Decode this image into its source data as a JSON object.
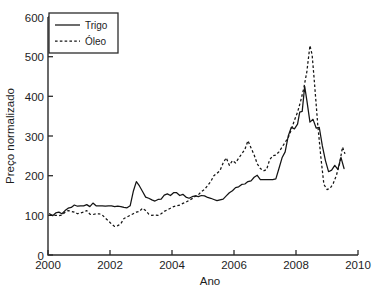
{
  "chart_data": {
    "type": "line",
    "title": "",
    "xlabel": "Ano",
    "ylabel": "Preço normalizado",
    "xlim": [
      2000,
      2010
    ],
    "ylim": [
      0,
      600
    ],
    "xticks": [
      2000,
      2002,
      2004,
      2006,
      2008,
      2010
    ],
    "yticks": [
      0,
      100,
      200,
      300,
      400,
      500,
      600
    ],
    "grid": false,
    "legend_position": "upper left",
    "legend_entries": [
      "Trigo",
      "Óleo"
    ],
    "series": [
      {
        "name": "Trigo",
        "style": "solid",
        "color": "#141414",
        "x": [
          2000.05,
          2000.15,
          2000.25,
          2000.35,
          2000.45,
          2000.55,
          2000.65,
          2000.75,
          2000.85,
          2000.95,
          2001.05,
          2001.15,
          2001.25,
          2001.35,
          2001.45,
          2001.55,
          2001.65,
          2001.75,
          2001.85,
          2001.95,
          2002.05,
          2002.15,
          2002.25,
          2002.35,
          2002.45,
          2002.55,
          2002.65,
          2002.75,
          2002.85,
          2002.95,
          2003.05,
          2003.15,
          2003.25,
          2003.35,
          2003.45,
          2003.55,
          2003.65,
          2003.75,
          2003.85,
          2003.95,
          2004.05,
          2004.15,
          2004.25,
          2004.35,
          2004.45,
          2004.55,
          2004.65,
          2004.75,
          2004.85,
          2004.95,
          2005.05,
          2005.15,
          2005.25,
          2005.35,
          2005.45,
          2005.55,
          2005.65,
          2005.75,
          2005.85,
          2005.95,
          2006.05,
          2006.15,
          2006.25,
          2006.35,
          2006.45,
          2006.55,
          2006.65,
          2006.75,
          2006.85,
          2006.95,
          2007.05,
          2007.15,
          2007.25,
          2007.35,
          2007.45,
          2007.55,
          2007.65,
          2007.75,
          2007.85,
          2007.95,
          2008.05,
          2008.12,
          2008.2,
          2008.28,
          2008.35,
          2008.45,
          2008.55,
          2008.65,
          2008.75,
          2008.85,
          2008.95,
          2009.05,
          2009.15,
          2009.25,
          2009.35,
          2009.45,
          2009.55
        ],
        "y": [
          104,
          99,
          106,
          108,
          104,
          112,
          118,
          120,
          126,
          123,
          124,
          124,
          127,
          122,
          131,
          124,
          124,
          124,
          123,
          124,
          124,
          122,
          123,
          122,
          120,
          119,
          124,
          160,
          185,
          174,
          160,
          146,
          143,
          139,
          136,
          140,
          141,
          151,
          154,
          150,
          157,
          157,
          150,
          153,
          146,
          143,
          147,
          149,
          147,
          150,
          149,
          145,
          143,
          140,
          137,
          139,
          141,
          149,
          157,
          162,
          170,
          172,
          178,
          179,
          185,
          187,
          196,
          201,
          190,
          190,
          190,
          190,
          190,
          192,
          218,
          245,
          260,
          300,
          322,
          318,
          330,
          360,
          362,
          425,
          390,
          335,
          342,
          320,
          322,
          275,
          238,
          210,
          214,
          226,
          216,
          246,
          218
        ]
      },
      {
        "name": "Óleo",
        "style": "dashed",
        "color": "#141414",
        "x": [
          2000.05,
          2000.15,
          2000.25,
          2000.35,
          2000.45,
          2000.55,
          2000.65,
          2000.75,
          2000.85,
          2000.95,
          2001.05,
          2001.15,
          2001.25,
          2001.35,
          2001.45,
          2001.55,
          2001.65,
          2001.75,
          2001.85,
          2001.95,
          2002.05,
          2002.15,
          2002.25,
          2002.35,
          2002.45,
          2002.55,
          2002.65,
          2002.75,
          2002.85,
          2002.95,
          2003.05,
          2003.15,
          2003.25,
          2003.35,
          2003.45,
          2003.55,
          2003.65,
          2003.75,
          2003.85,
          2003.95,
          2004.05,
          2004.15,
          2004.25,
          2004.35,
          2004.45,
          2004.55,
          2004.65,
          2004.75,
          2004.85,
          2004.95,
          2005.05,
          2005.15,
          2005.25,
          2005.35,
          2005.45,
          2005.55,
          2005.65,
          2005.75,
          2005.85,
          2005.95,
          2006.05,
          2006.15,
          2006.25,
          2006.35,
          2006.45,
          2006.55,
          2006.65,
          2006.75,
          2006.85,
          2006.95,
          2007.05,
          2007.15,
          2007.25,
          2007.35,
          2007.45,
          2007.55,
          2007.65,
          2007.75,
          2007.85,
          2007.95,
          2008.05,
          2008.15,
          2008.25,
          2008.35,
          2008.45,
          2008.52,
          2008.6,
          2008.7,
          2008.8,
          2008.9,
          2009.0,
          2009.1,
          2009.2,
          2009.3,
          2009.4,
          2009.5,
          2009.58
        ],
        "y": [
          100,
          100,
          100,
          99,
          101,
          108,
          112,
          110,
          108,
          104,
          106,
          108,
          112,
          103,
          102,
          104,
          104,
          101,
          93,
          86,
          78,
          72,
          74,
          79,
          92,
          96,
          100,
          104,
          108,
          110,
          118,
          112,
          103,
          100,
          101,
          100,
          104,
          110,
          114,
          118,
          122,
          124,
          126,
          130,
          133,
          138,
          142,
          148,
          152,
          160,
          165,
          175,
          185,
          200,
          206,
          213,
          232,
          245,
          226,
          238,
          232,
          244,
          255,
          266,
          288,
          270,
          252,
          230,
          218,
          212,
          215,
          240,
          250,
          252,
          260,
          272,
          284,
          296,
          316,
          340,
          360,
          388,
          420,
          462,
          528,
          505,
          430,
          330,
          248,
          178,
          165,
          168,
          180,
          200,
          228,
          272,
          255
        ]
      }
    ]
  },
  "axes": {
    "x_tick_labels": [
      "2000",
      "2002",
      "2004",
      "2006",
      "2008",
      "2010"
    ],
    "y_tick_labels": [
      "0",
      "100",
      "200",
      "300",
      "400",
      "500",
      "600"
    ],
    "x_axis_title": "Ano",
    "y_axis_title": "Preço normalizado"
  },
  "legend": {
    "items": [
      {
        "label": "Trigo",
        "style": "solid"
      },
      {
        "label": "Óleo",
        "style": "dashed"
      }
    ]
  }
}
